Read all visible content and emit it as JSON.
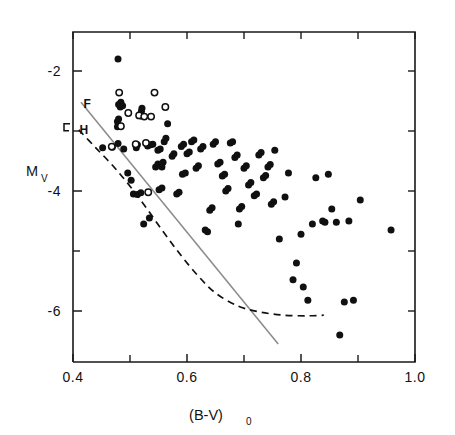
{
  "chart_data": {
    "type": "scatter",
    "title": "",
    "xlabel": "(B-V)_0",
    "xlabel_main": "(B-V)",
    "xlabel_sub": "0",
    "ylabel": "M_V",
    "ylabel_main": "M",
    "ylabel_sub": "V",
    "xlim": [
      0.4,
      1.0
    ],
    "ylim": [
      -1.35,
      -6.85
    ],
    "grid": false,
    "legend_position": "none",
    "x_ticks_major": [
      0.4,
      0.6,
      0.8,
      1.0
    ],
    "x_ticks_major_labels": [
      "0.4",
      "0.6",
      "0.8",
      "1.0"
    ],
    "x_ticks_minor": [
      0.5,
      0.7,
      0.9
    ],
    "y_ticks_major": [
      -6,
      -4,
      -2
    ],
    "y_ticks_major_labels": [
      "-6",
      "-4",
      "-2"
    ],
    "y_ticks_minor": [
      -5,
      -3
    ],
    "axis_color": "#1a1a1a",
    "marker_filled_color": "#101010",
    "marker_open_color": "#ffffff",
    "dashed_curve_color": "#111111",
    "solid_line_color": "#8a8a8a",
    "annotations": [
      {
        "text": "H",
        "x": 0.408,
        "y": -2.98,
        "name": "h-curve-label"
      },
      {
        "text": "F",
        "x": 0.415,
        "y": -2.55,
        "name": "f-curve-label"
      }
    ],
    "series": [
      {
        "name": "filled-circles",
        "marker": "filled circle",
        "points": [
          [
            0.452,
            -3.28
          ],
          [
            0.469,
            -3.27
          ],
          [
            0.479,
            -3.21
          ],
          [
            0.478,
            -2.93
          ],
          [
            0.478,
            -2.84
          ],
          [
            0.48,
            -2.8
          ],
          [
            0.483,
            -2.6
          ],
          [
            0.487,
            -2.58
          ],
          [
            0.48,
            -2.56
          ],
          [
            0.484,
            -2.52
          ],
          [
            0.479,
            -1.8
          ],
          [
            0.489,
            -3.3
          ],
          [
            0.496,
            -3.7
          ],
          [
            0.502,
            -3.82
          ],
          [
            0.506,
            -4.05
          ],
          [
            0.511,
            -3.28
          ],
          [
            0.513,
            -3.23
          ],
          [
            0.519,
            -2.75
          ],
          [
            0.52,
            -2.67
          ],
          [
            0.521,
            -2.62
          ],
          [
            0.524,
            -4.55
          ],
          [
            0.513,
            -4.06
          ],
          [
            0.519,
            -4.03
          ],
          [
            0.531,
            -3.25
          ],
          [
            0.536,
            -3.23
          ],
          [
            0.54,
            -3.22
          ],
          [
            0.534,
            -4.45
          ],
          [
            0.549,
            -3.32
          ],
          [
            0.553,
            -3.3
          ],
          [
            0.551,
            -3.98
          ],
          [
            0.556,
            -3.95
          ],
          [
            0.545,
            -3.6
          ],
          [
            0.549,
            -3.55
          ],
          [
            0.556,
            -3.6
          ],
          [
            0.558,
            -3.52
          ],
          [
            0.56,
            -3.18
          ],
          [
            0.563,
            -3.12
          ],
          [
            0.566,
            -2.88
          ],
          [
            0.574,
            -3.42
          ],
          [
            0.577,
            -3.38
          ],
          [
            0.582,
            -4.05
          ],
          [
            0.586,
            -4.02
          ],
          [
            0.592,
            -3.72
          ],
          [
            0.597,
            -3.7
          ],
          [
            0.59,
            -3.26
          ],
          [
            0.594,
            -3.22
          ],
          [
            0.6,
            -3.38
          ],
          [
            0.604,
            -3.35
          ],
          [
            0.608,
            -3.18
          ],
          [
            0.612,
            -3.15
          ],
          [
            0.616,
            -3.62
          ],
          [
            0.62,
            -3.58
          ],
          [
            0.624,
            -3.3
          ],
          [
            0.628,
            -3.26
          ],
          [
            0.632,
            -4.65
          ],
          [
            0.636,
            -4.68
          ],
          [
            0.64,
            -4.32
          ],
          [
            0.644,
            -4.28
          ],
          [
            0.646,
            -3.22
          ],
          [
            0.65,
            -3.18
          ],
          [
            0.654,
            -3.55
          ],
          [
            0.658,
            -3.52
          ],
          [
            0.662,
            -3.75
          ],
          [
            0.666,
            -3.72
          ],
          [
            0.668,
            -4.0
          ],
          [
            0.672,
            -3.96
          ],
          [
            0.676,
            -3.2
          ],
          [
            0.68,
            -3.18
          ],
          [
            0.684,
            -3.44
          ],
          [
            0.688,
            -3.4
          ],
          [
            0.692,
            -4.3
          ],
          [
            0.696,
            -4.26
          ],
          [
            0.7,
            -3.62
          ],
          [
            0.704,
            -3.58
          ],
          [
            0.708,
            -3.9
          ],
          [
            0.712,
            -3.86
          ],
          [
            0.69,
            -4.55
          ],
          [
            0.718,
            -4.08
          ],
          [
            0.722,
            -4.05
          ],
          [
            0.726,
            -3.4
          ],
          [
            0.73,
            -3.36
          ],
          [
            0.734,
            -3.78
          ],
          [
            0.738,
            -3.74
          ],
          [
            0.742,
            -3.6
          ],
          [
            0.746,
            -3.56
          ],
          [
            0.748,
            -4.22
          ],
          [
            0.752,
            -4.18
          ],
          [
            0.754,
            -3.32
          ],
          [
            0.762,
            -4.8
          ],
          [
            0.772,
            -4.1
          ],
          [
            0.778,
            -3.7
          ],
          [
            0.786,
            -5.48
          ],
          [
            0.792,
            -5.2
          ],
          [
            0.8,
            -4.72
          ],
          [
            0.804,
            -5.6
          ],
          [
            0.812,
            -5.82
          ],
          [
            0.82,
            -4.55
          ],
          [
            0.826,
            -3.78
          ],
          [
            0.838,
            -4.5
          ],
          [
            0.842,
            -4.52
          ],
          [
            0.848,
            -3.72
          ],
          [
            0.854,
            -4.3
          ],
          [
            0.862,
            -4.52
          ],
          [
            0.868,
            -6.4
          ],
          [
            0.876,
            -5.85
          ],
          [
            0.884,
            -4.5
          ],
          [
            0.892,
            -5.82
          ],
          [
            0.904,
            -4.15
          ],
          [
            0.958,
            -4.65
          ]
        ]
      },
      {
        "name": "open-circles",
        "marker": "open circle",
        "points": [
          [
            0.468,
            -3.26
          ],
          [
            0.484,
            -2.92
          ],
          [
            0.481,
            -2.36
          ],
          [
            0.497,
            -2.7
          ],
          [
            0.51,
            -3.22
          ],
          [
            0.516,
            -2.74
          ],
          [
            0.525,
            -2.76
          ],
          [
            0.528,
            -3.2
          ],
          [
            0.532,
            -4.02
          ],
          [
            0.537,
            -2.76
          ],
          [
            0.543,
            -2.36
          ],
          [
            0.562,
            -2.6
          ]
        ]
      }
    ],
    "curves": [
      {
        "name": "dashed-curve",
        "style": "dashed",
        "label": "H",
        "points": [
          [
            0.41,
            -2.98
          ],
          [
            0.44,
            -3.28
          ],
          [
            0.47,
            -3.58
          ],
          [
            0.5,
            -3.92
          ],
          [
            0.53,
            -4.3
          ],
          [
            0.56,
            -4.7
          ],
          [
            0.59,
            -5.08
          ],
          [
            0.62,
            -5.42
          ],
          [
            0.65,
            -5.7
          ],
          [
            0.69,
            -5.92
          ],
          [
            0.73,
            -6.02
          ],
          [
            0.77,
            -6.07
          ],
          [
            0.81,
            -6.08
          ],
          [
            0.84,
            -6.07
          ]
        ]
      },
      {
        "name": "solid-line",
        "style": "solid",
        "label": "F",
        "points": [
          [
            0.414,
            -2.52
          ],
          [
            0.76,
            -6.55
          ]
        ]
      }
    ]
  },
  "figure": {
    "caption": ""
  }
}
